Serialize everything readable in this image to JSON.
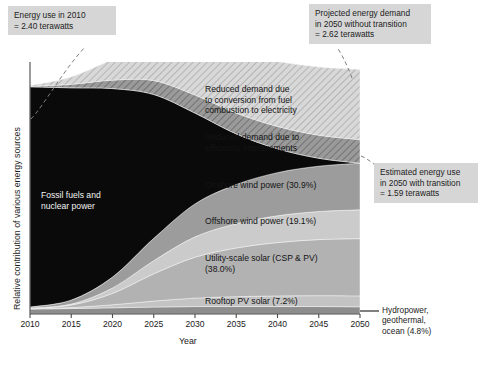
{
  "chart_data": {
    "type": "area",
    "title": "",
    "xlabel": "Year",
    "ylabel": "Relative contribution of various energy sources",
    "x": [
      2010,
      2015,
      2020,
      2025,
      2030,
      2035,
      2040,
      2045,
      2050
    ],
    "xlim": [
      2010,
      2050
    ],
    "ylim": [
      0,
      2.62
    ],
    "yunits": "terawatts",
    "grid": false,
    "legend_position": "inline-labels",
    "xticklabels": [
      "2010",
      "2015",
      "2020",
      "2025",
      "2030",
      "2035",
      "2040",
      "2045",
      "2050"
    ],
    "stack_order_top_to_bottom": [
      "Reduced demand due to conversion from fuel combustion to electricity",
      "Reduced demand due to efficiency improvements",
      "Fossil fuels and nuclear power",
      "Onshore wind power",
      "Offshore wind power",
      "Utility-scale solar (CSP & PV)",
      "Rooftop PV solar",
      "Hydropower, geothermal, ocean"
    ],
    "series": [
      {
        "name": "Hydropower, geothermal, ocean",
        "label": "Hydropower,\ngeothermal,\nocean (4.8%)",
        "share_2050_pct": 4.8,
        "color": "#8d8d8d",
        "hatched": false,
        "values_frac": [
          0.02,
          0.022,
          0.025,
          0.028,
          0.03,
          0.03,
          0.03,
          0.03,
          0.029
        ]
      },
      {
        "name": "Rooftop PV solar",
        "label": "Rooftop PV solar (7.2%)",
        "share_2050_pct": 7.2,
        "color": "#c3c3c3",
        "hatched": false,
        "values_frac": [
          0.001,
          0.004,
          0.012,
          0.024,
          0.034,
          0.04,
          0.043,
          0.044,
          0.044
        ]
      },
      {
        "name": "Utility-scale solar (CSP & PV)",
        "label": "Utility-scale solar (CSP & PV)\n(38.0%)",
        "share_2050_pct": 38.0,
        "color": "#b2b2b2",
        "hatched": false,
        "values_frac": [
          0.002,
          0.01,
          0.046,
          0.11,
          0.165,
          0.196,
          0.215,
          0.226,
          0.231
        ]
      },
      {
        "name": "Offshore wind power",
        "label": "Offshore wind power (19.1%)",
        "share_2050_pct": 19.1,
        "color": "#cbcbcb",
        "hatched": false,
        "values_frac": [
          0.001,
          0.004,
          0.022,
          0.053,
          0.082,
          0.098,
          0.108,
          0.113,
          0.116
        ]
      },
      {
        "name": "Onshore wind power",
        "label": "Onshore wind power (30.9%)",
        "share_2050_pct": 30.9,
        "color": "#9c9c9c",
        "hatched": false,
        "values_frac": [
          0.004,
          0.016,
          0.044,
          0.09,
          0.133,
          0.158,
          0.174,
          0.183,
          0.188
        ]
      },
      {
        "name": "Fossil fuels and nuclear power",
        "label": "Fossil fuels and\nnuclear power",
        "color": "#0a0a0a",
        "hatched": false,
        "values_frac": [
          0.888,
          0.856,
          0.76,
          0.58,
          0.366,
          0.204,
          0.096,
          0.032,
          0.0
        ]
      },
      {
        "name": "Reduced demand due to efficiency improvements",
        "label": "Reduced demand due to\nefficiency improvements",
        "color": "#8f8f8f",
        "hatched": true,
        "values_frac": [
          0.002,
          0.014,
          0.034,
          0.056,
          0.073,
          0.084,
          0.09,
          0.093,
          0.095
        ]
      },
      {
        "name": "Reduced demand due to conversion from fuel combustion to electricity",
        "label": "Reduced demand due\nto conversion from fuel\ncombustion to electricity",
        "color": "#d0d0d0",
        "hatched": true,
        "values_frac": [
          0.003,
          0.03,
          0.083,
          0.148,
          0.203,
          0.24,
          0.262,
          0.275,
          0.283
        ]
      }
    ],
    "total_envelope_frac": [
      0.921,
      0.956,
      1.026,
      1.089,
      1.086,
      1.05,
      1.018,
      0.996,
      0.986
    ]
  },
  "annotations": {
    "left_top": "Energy use in 2010\n= 2.40 terawatts",
    "right_top": "Projected energy demand\nin 2050 without transition\n= 2.62 terawatts",
    "right_mid": "Estimated energy use\nin 2050 with transition\n= 1.59 terawatts",
    "right_bottom": "Hydropower,\ngeothermal,\nocean (4.8%)"
  },
  "axes": {
    "xlabel": "Year",
    "ylabel": "Relative contribution of various energy sources",
    "xticks": [
      "2010",
      "2015",
      "2020",
      "2025",
      "2030",
      "2035",
      "2040",
      "2045",
      "2050"
    ]
  },
  "colors": {
    "annotation_background": "#d6d6d6",
    "text": "#1b1b1b",
    "axis": "#4a4a4a",
    "fossil": "#0a0a0a",
    "plot_background": "#ffffff"
  }
}
